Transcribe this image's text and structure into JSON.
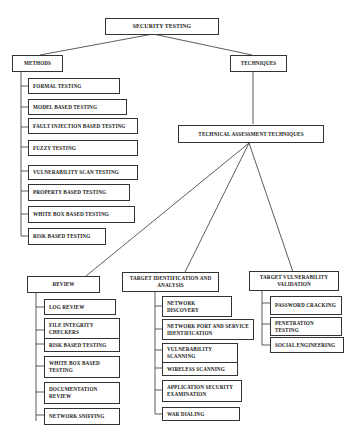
{
  "diagram": {
    "root": "SECURITY TESTING",
    "methods": {
      "label": "METHODS",
      "items": [
        "FORMAL TESTING",
        "MODEL BASED TESTING",
        "FAULT INJECTION BASED TESTING",
        "FUZZY TESTING",
        "VULNERABILITY SCAN TESTING",
        "PROPERTY BASED TESTING",
        "WHITE BOX BASED TESTING",
        "RISK BASED TESTING"
      ]
    },
    "techniques": {
      "label": "TECHNIQUES",
      "assessment": {
        "label": "TECHNICAL ASSESSMENT TECHNIQUES",
        "review": {
          "label": "REVIEW",
          "items": [
            "LOG REVIEW",
            "FILE INTEGRITY CHECKERS",
            "RISK BASED TESTING",
            "WHITE BOX BASED TESTING",
            "DOCUMENTATION REVIEW",
            "NETWORK SNIFFING"
          ]
        },
        "target_identification": {
          "label": "TARGET IDENTIFICATION AND ANALYSIS",
          "items": [
            "NETWORK DISCOVERY",
            "NETWORK PORT AND SERVICE IDENTIFICATION",
            "VULNERABILITY SCANNING",
            "WIRELESS SCANNING",
            "APPLICATION SECURITY EXAMINATION",
            "WAR DIALING"
          ]
        },
        "target_validation": {
          "label": "TARGET VULNERABILITY VALIDATION",
          "items": [
            "PASSWORD CRACKING",
            "PENETRATION TESTING",
            "SOCIAL ENGINEERING"
          ]
        }
      }
    }
  },
  "colors": {
    "line": "#333333",
    "background": "#ffffff",
    "text": "#1a1a1a"
  }
}
